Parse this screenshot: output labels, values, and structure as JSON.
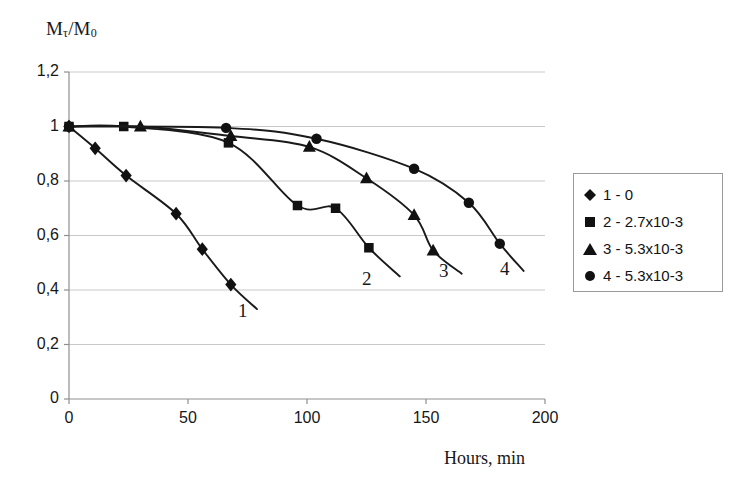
{
  "chart_data": {
    "type": "line",
    "title": "",
    "xlabel": "Hours, min",
    "ylabel": "Mτ/M0",
    "ylabel_base": "M",
    "ylabel_sub1": "τ",
    "ylabel_mid": "/M",
    "ylabel_sub2": "0",
    "xlim": [
      0,
      200
    ],
    "ylim": [
      0,
      1.2
    ],
    "xticks": [
      "0",
      "50",
      "100",
      "150",
      "200"
    ],
    "xtick_values": [
      0,
      50,
      100,
      150,
      200
    ],
    "yticks": [
      "0",
      "0,2",
      "0,4",
      "0,6",
      "0,8",
      "1",
      "1,2"
    ],
    "ytick_values": [
      0,
      0.2,
      0.4,
      0.6,
      0.8,
      1.0,
      1.2
    ],
    "grid": "horizontal",
    "legend_position": "right",
    "decimal_separator": ",",
    "line_color": "#1a1a1a",
    "marker_color": "#111111",
    "grid_color": "#c9c9c9",
    "axis_color": "#8f8f8f",
    "series": [
      {
        "name": "1 - 0",
        "curve_label": "1",
        "marker": "diamond",
        "x": [
          0,
          11,
          24,
          45,
          56,
          68
        ],
        "values": [
          1.0,
          0.92,
          0.82,
          0.68,
          0.55,
          0.42
        ],
        "tail_x": [
          79
        ],
        "tail_values": [
          0.33
        ]
      },
      {
        "name": "2 - 2.7x10-3",
        "curve_label": "2",
        "marker": "square",
        "x": [
          0,
          23,
          67,
          96,
          112,
          126
        ],
        "values": [
          1.0,
          1.0,
          0.94,
          0.71,
          0.7,
          0.555
        ],
        "tail_x": [
          139
        ],
        "tail_values": [
          0.45
        ]
      },
      {
        "name": "3 - 5.3x10-3",
        "curve_label": "3",
        "marker": "triangle",
        "x": [
          0,
          30,
          68,
          101,
          125,
          145,
          153
        ],
        "values": [
          1.0,
          1.0,
          0.965,
          0.925,
          0.81,
          0.675,
          0.545
        ],
        "tail_x": [
          165
        ],
        "tail_values": [
          0.46
        ]
      },
      {
        "name": "4 - 5.3x10-3",
        "curve_label": "4",
        "marker": "circle",
        "x": [
          0,
          66,
          104,
          145,
          168,
          181
        ],
        "values": [
          1.0,
          0.995,
          0.955,
          0.845,
          0.72,
          0.57
        ],
        "tail_x": [
          191
        ],
        "tail_values": [
          0.47
        ]
      }
    ],
    "legend": [
      {
        "marker": "diamond",
        "label": "1 - 0"
      },
      {
        "marker": "square",
        "label": "2 - 2.7x10-3"
      },
      {
        "marker": "triangle",
        "label": "3 - 5.3x10-3"
      },
      {
        "marker": "circle",
        "label": "4 - 5.3x10-3"
      }
    ],
    "curve_end_labels": [
      {
        "text": "1",
        "x": 238,
        "y": 300
      },
      {
        "text": "2",
        "x": 362,
        "y": 268
      },
      {
        "text": "3",
        "x": 439,
        "y": 260
      },
      {
        "text": "4",
        "x": 500,
        "y": 258
      }
    ]
  }
}
